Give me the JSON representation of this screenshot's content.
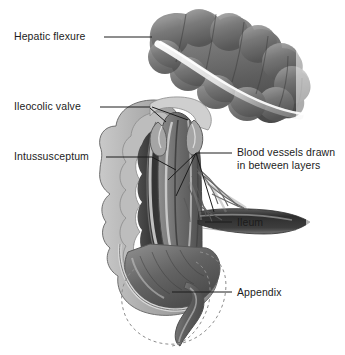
{
  "figure": {
    "style": "grayscale medical line-and-wash illustration",
    "background_color": "#ffffff",
    "ink_color": "#1c1c1c"
  },
  "labels": [
    {
      "id": "hepatic-flexure",
      "text": "Hepatic flexure",
      "lines": [
        "Hepatic flexure"
      ],
      "align": "left",
      "x": 14,
      "y": 30,
      "leader": {
        "from": [
          104,
          37
        ],
        "to": [
          152,
          37
        ]
      }
    },
    {
      "id": "ileocolic-valve",
      "text": "Ileocolic valve",
      "lines": [
        "Ileocolic valve"
      ],
      "align": "left",
      "x": 14,
      "y": 100,
      "leader": {
        "from": [
          100,
          107
        ],
        "to": [
          150,
          107
        ]
      }
    },
    {
      "id": "intussusceptum",
      "text": "Intussusceptum",
      "lines": [
        "Intussusceptum"
      ],
      "align": "left",
      "x": 14,
      "y": 150,
      "leader": {
        "from": [
          106,
          157
        ],
        "to": [
          152,
          157
        ]
      }
    },
    {
      "id": "blood-vessels",
      "text": "Blood vessels drawn in between layers",
      "lines": [
        "Blood vessels drawn",
        "in between layers"
      ],
      "align": "left",
      "x": 237,
      "y": 146,
      "leader": {
        "from": [
          232,
          153
        ],
        "to": [
          196,
          153
        ]
      }
    },
    {
      "id": "ileum",
      "text": "Ileum",
      "lines": [
        "Ileum"
      ],
      "align": "left",
      "x": 237,
      "y": 216,
      "leader": {
        "from": [
          232,
          222
        ],
        "to": [
          205,
          222
        ]
      }
    },
    {
      "id": "appendix",
      "text": "Appendix",
      "lines": [
        "Appendix"
      ],
      "align": "left",
      "x": 237,
      "y": 286,
      "leader": {
        "from": [
          232,
          292
        ],
        "to": [
          172,
          292
        ]
      }
    }
  ],
  "anatomy": {
    "transverse_colon": {
      "name": "transverse colon with haustra",
      "haustra_count": 8
    },
    "hepatic_flexure": {
      "name": "hepatic flexure"
    },
    "ascending_colon": {
      "name": "ascending colon, cut away to show lumen"
    },
    "intussusceptum": {
      "name": "intussusceptum (telescoped bowel)"
    },
    "ileocolic_valve": {
      "name": "ileocolic valve"
    },
    "blood_vessels": {
      "name": "mesenteric blood vessels drawn between layers",
      "branch_count": 3
    },
    "ileum": {
      "name": "ileum"
    },
    "cecum": {
      "name": "cecum"
    },
    "appendix": {
      "name": "appendix"
    },
    "dashed_outline": {
      "name": "dashed outline of original cecum position",
      "stroke": "dashed"
    }
  },
  "palette": {
    "ink": "#1c1c1c",
    "wall_light": "#d9d9d9",
    "wall_mid": "#9a9a9a",
    "wall_dark": "#6b6b6b",
    "lumen_dark": "#3a3a3a",
    "lumen_deep": "#262626",
    "highlight": "#f2f2f2",
    "dashed": "#8d8d8d"
  }
}
